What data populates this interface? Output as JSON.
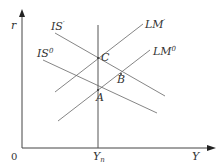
{
  "diagram": {
    "type": "IS-LM diagram",
    "colors": {
      "line": "#555555",
      "axis": "#333333",
      "text": "#333333"
    },
    "axes": {
      "y_label": "r",
      "x_label": "Y",
      "origin_label": "0",
      "yn_label": "Y",
      "yn_sub": "n"
    },
    "curves": {
      "is_prime": {
        "label": "IS",
        "sup": "′"
      },
      "is_zero": {
        "label": "IS",
        "sup": "0"
      },
      "lm_prime": {
        "label": "LM",
        "sup": "′"
      },
      "lm_zero": {
        "label": "LM",
        "sup": "0"
      }
    },
    "points": {
      "a": "A",
      "b": "B",
      "c": "C"
    }
  }
}
